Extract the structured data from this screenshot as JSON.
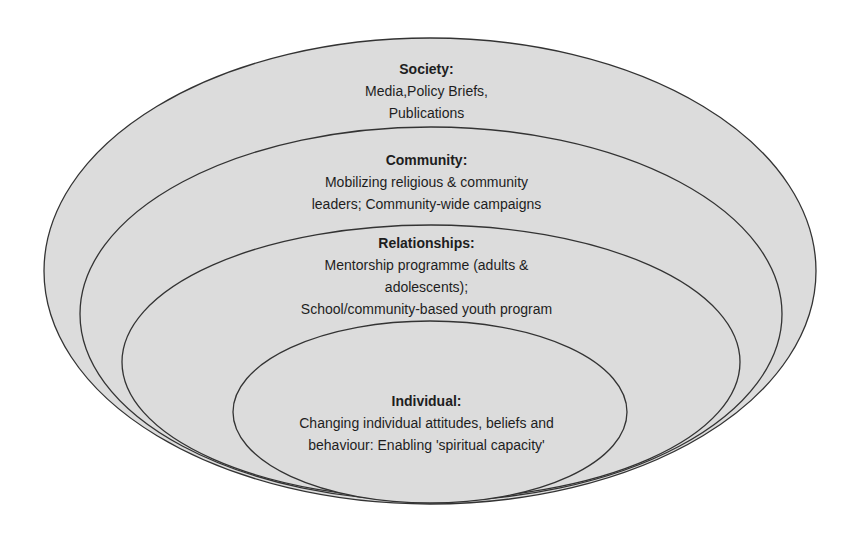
{
  "diagram": {
    "type": "nested-ellipses",
    "fill_color": "#dcdcdc",
    "stroke_color": "#333333",
    "levels": [
      {
        "id": "society",
        "title": "Society:",
        "lines": [
          "Media,Policy Briefs,",
          "Publications"
        ]
      },
      {
        "id": "community",
        "title": "Community:",
        "lines": [
          "Mobilizing religious & community",
          "leaders; Community-wide campaigns"
        ]
      },
      {
        "id": "relationships",
        "title": "Relationships:",
        "lines": [
          "Mentorship programme (adults &",
          "adolescents);",
          "School/community-based youth program"
        ]
      },
      {
        "id": "individual",
        "title": "Individual:",
        "lines": [
          "Changing individual attitudes, beliefs and",
          "behaviour: Enabling 'spiritual capacity'"
        ]
      }
    ]
  }
}
